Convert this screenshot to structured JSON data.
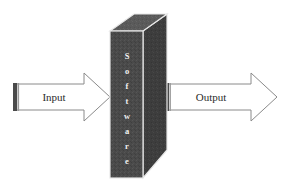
{
  "diagram": {
    "background_color": "#ffffff",
    "box": {
      "name": "software-box",
      "label": "Software",
      "orientation": "vertical-stacked-letters",
      "letters": [
        "S",
        "o",
        "f",
        "t",
        "w",
        "a",
        "r",
        "e"
      ],
      "front_face_color": "#4a4a4a",
      "side_face_color": "#3d3d3d",
      "top_face_color": "#5a5a5a",
      "edge_color": "#e8e8e8",
      "text_color": "#f2f2f2"
    },
    "input_arrow": {
      "name": "input-arrow",
      "label": "Input",
      "direction": "right",
      "fill_color": "#ffffff",
      "stroke_color": "#8a8a8a",
      "tail_bar_color": "#4a4a4a"
    },
    "output_arrow": {
      "name": "output-arrow",
      "label": "Output",
      "direction": "right",
      "fill_color": "#ffffff",
      "stroke_color": "#8a8a8a",
      "tail_bar_color": "#4a4a4a"
    }
  }
}
